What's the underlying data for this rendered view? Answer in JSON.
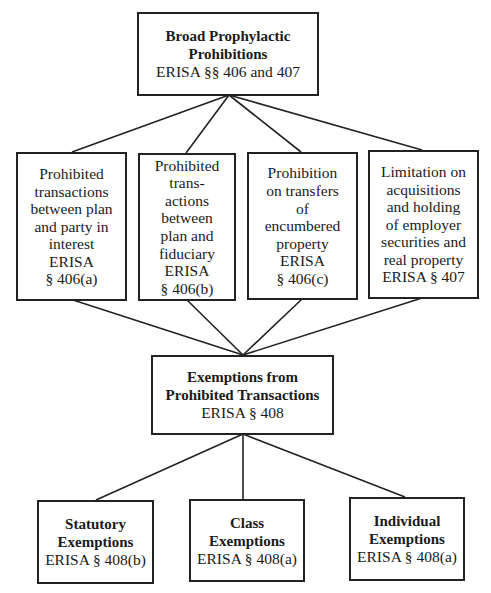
{
  "diagram": {
    "root": {
      "title_lines": [
        "Broad Prophylactic",
        "Prohibitions"
      ],
      "subtitle": "ERISA §§ 406 and 407"
    },
    "prohibitions": [
      {
        "lines": [
          "Prohibited",
          "transactions",
          "between plan",
          "and party in",
          "interest",
          "ERISA",
          "§ 406(a)"
        ]
      },
      {
        "lines": [
          "Prohibited",
          "trans-",
          "actions",
          "between",
          "plan and",
          "fiduciary",
          "ERISA",
          "§ 406(b)"
        ]
      },
      {
        "lines": [
          "Prohibition",
          "on transfers",
          "of",
          "encumbered",
          "property",
          "ERISA",
          "§ 406(c)"
        ]
      },
      {
        "lines": [
          "Limitation on",
          "acquisitions",
          "and holding",
          "of employer",
          "securities and",
          "real property",
          "ERISA § 407"
        ]
      }
    ],
    "exemptions_hub": {
      "title_lines": [
        "Exemptions from",
        "Prohibited Transactions"
      ],
      "subtitle": "ERISA § 408"
    },
    "exemptions": [
      {
        "title_lines": [
          "Statutory",
          "Exemptions"
        ],
        "subtitle": "ERISA § 408(b)"
      },
      {
        "title_lines": [
          "Class",
          "Exemptions"
        ],
        "subtitle": "ERISA § 408(a)"
      },
      {
        "title_lines": [
          "Individual",
          "Exemptions"
        ],
        "subtitle": "ERISA § 408(a)"
      }
    ],
    "colors": {
      "line": "#222222",
      "border": "#222222",
      "background": "#ffffff"
    }
  }
}
